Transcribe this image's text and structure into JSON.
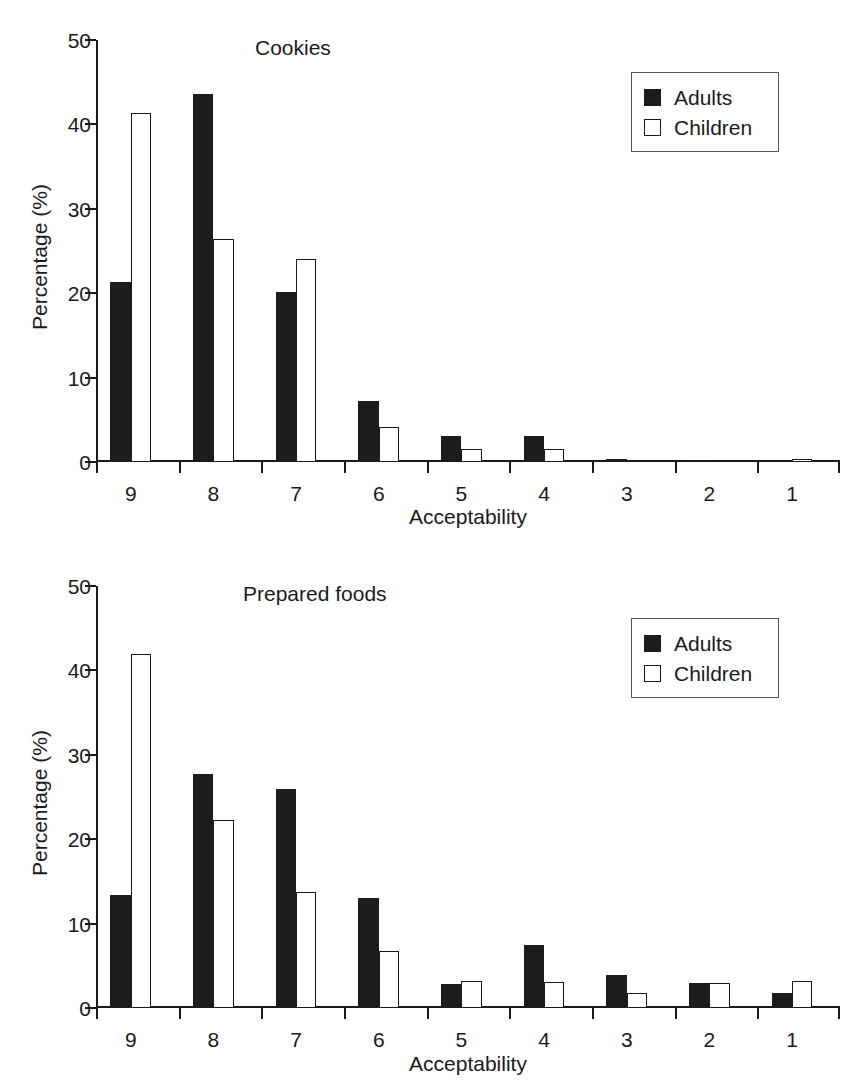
{
  "runhead": "",
  "legend": {
    "entries": [
      {
        "label": "Adults",
        "swatch": "filled-square-icon"
      },
      {
        "label": "Children",
        "swatch": "open-square-icon"
      }
    ]
  },
  "axes": {
    "ylabel": "Percentage (%)",
    "xlabel": "Acceptability",
    "yticks": [
      0,
      10,
      20,
      30,
      40,
      50
    ],
    "xticks": [
      "9",
      "8",
      "7",
      "6",
      "5",
      "4",
      "3",
      "2",
      "1"
    ]
  },
  "chart_data": [
    {
      "type": "bar",
      "title": "Cookies",
      "xlabel": "Acceptability",
      "ylabel": "Percentage (%)",
      "ylim": [
        0,
        50
      ],
      "ytick_values": [
        0,
        10,
        20,
        30,
        40,
        50
      ],
      "grid": false,
      "legend_position": "top-right",
      "categories": [
        "9",
        "8",
        "7",
        "6",
        "5",
        "4",
        "3",
        "2",
        "1"
      ],
      "series": [
        {
          "name": "Adults",
          "values": [
            21.3,
            43.6,
            20.1,
            7.2,
            3.1,
            3.1,
            0.4,
            0.2,
            0.0
          ]
        },
        {
          "name": "Children",
          "values": [
            41.3,
            26.4,
            24.0,
            4.1,
            1.5,
            1.5,
            0.2,
            0.0,
            0.4
          ]
        }
      ]
    },
    {
      "type": "bar",
      "title": "Prepared foods",
      "xlabel": "Acceptability",
      "ylabel": "Percentage (%)",
      "ylim": [
        0,
        50
      ],
      "ytick_values": [
        0,
        10,
        20,
        30,
        40,
        50
      ],
      "grid": false,
      "legend_position": "top-right",
      "categories": [
        "9",
        "8",
        "7",
        "6",
        "5",
        "4",
        "3",
        "2",
        "1"
      ],
      "series": [
        {
          "name": "Adults",
          "values": [
            13.4,
            27.7,
            26.0,
            13.0,
            2.9,
            7.5,
            3.9,
            3.0,
            1.8
          ]
        },
        {
          "name": "Children",
          "values": [
            42.0,
            22.3,
            13.8,
            6.8,
            3.2,
            3.1,
            1.8,
            3.0,
            3.2
          ]
        }
      ]
    }
  ]
}
